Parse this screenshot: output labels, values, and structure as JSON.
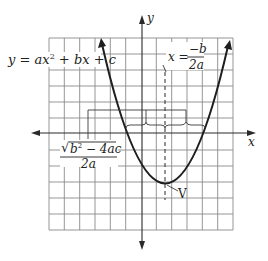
{
  "diagram": {
    "type": "parabola-graph",
    "equation_label": "y = ax² + bx + c",
    "equation_parts": {
      "y": "y",
      "eq": " = ",
      "ax": "ax",
      "sup2": "2",
      "rest": " + bx + c"
    },
    "axes": {
      "x_label": "x",
      "y_label": "y"
    },
    "axis_of_symmetry": {
      "lhs": "x = ",
      "numerator": "−b",
      "denominator": "2a"
    },
    "half_width": {
      "radical": "√",
      "radicand": "b",
      "radicand_sup": "2",
      "radicand_rest": " − 4ac",
      "denominator": "2a"
    },
    "vertex_label": "V",
    "grid": {
      "columns": 12,
      "rows": 12
    },
    "colors": {
      "grid": "#8a8a8a",
      "curve": "#1e1e1e",
      "text": "#222222"
    }
  }
}
